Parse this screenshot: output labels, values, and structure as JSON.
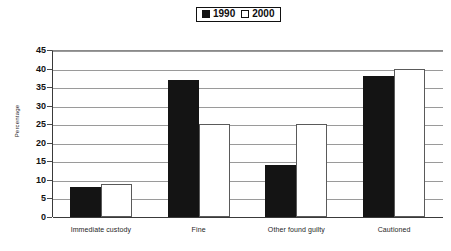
{
  "chart_data": {
    "type": "bar",
    "title": "",
    "xlabel": "",
    "ylabel": "Percentage",
    "ylim": [
      0,
      45
    ],
    "ytick_step": 5,
    "yticks": [
      45,
      40,
      35,
      30,
      25,
      20,
      15,
      10,
      5,
      0
    ],
    "grid": true,
    "legend_position": "top-center",
    "categories": [
      "Immediate custody",
      "Fine",
      "Other found guilty",
      "Cautioned"
    ],
    "series": [
      {
        "name": "1990",
        "color": "#141414",
        "style": "filled",
        "values": [
          8,
          37,
          14,
          38
        ]
      },
      {
        "name": "2000",
        "color": "#ffffff",
        "style": "hollow",
        "values": [
          9,
          25,
          25,
          40
        ]
      }
    ]
  },
  "legend": {
    "entries": [
      {
        "label": "1990",
        "swatch": "filled-square-icon"
      },
      {
        "label": "2000",
        "swatch": "hollow-square-icon"
      }
    ]
  },
  "colors": {
    "series_1990": "#141414",
    "series_2000": "#ffffff",
    "gridline": "#9a9a9a",
    "axis": "#3a3a3a",
    "text": "#111111",
    "background": "#ffffff"
  }
}
